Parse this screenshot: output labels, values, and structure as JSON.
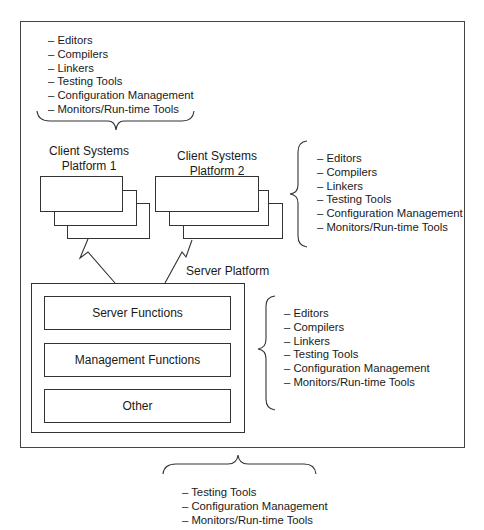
{
  "diagram": {
    "top_tools": {
      "items": [
        "– Editors",
        "– Compilers",
        "– Linkers",
        "– Testing Tools",
        "– Configuration Management",
        "– Monitors/Run-time Tools"
      ]
    },
    "client1": {
      "label_line1": "Client Systems",
      "label_line2": "Platform 1"
    },
    "client2": {
      "label_line1": "Client Systems",
      "label_line2": "Platform 2"
    },
    "client2_tools": {
      "items": [
        "– Editors",
        "– Compilers",
        "– Linkers",
        "– Testing Tools",
        "– Configuration Management",
        "– Monitors/Run-time Tools"
      ]
    },
    "server": {
      "label": "Server Platform",
      "functions": [
        "Server Functions",
        "Management Functions",
        "Other"
      ]
    },
    "server_tools": {
      "items": [
        "– Editors",
        "– Compilers",
        "– Linkers",
        "– Testing Tools",
        "– Configuration Management",
        "– Monitors/Run-time Tools"
      ]
    },
    "overall_tools": {
      "items": [
        "– Testing Tools",
        "– Configuration Management",
        "– Monitors/Run-time Tools"
      ]
    }
  }
}
